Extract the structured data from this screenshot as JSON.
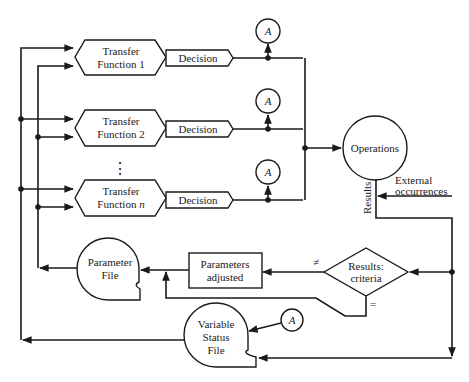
{
  "diagram": {
    "transfer_functions": [
      {
        "line1": "Transfer",
        "line2": "Function 1",
        "decision": "Decision",
        "monitor": "A"
      },
      {
        "line1": "Transfer",
        "line2": "Function 2",
        "decision": "Decision",
        "monitor": "A"
      },
      {
        "line1": "Transfer",
        "line2": "Function ",
        "line2_italic": "n",
        "decision": "Decision",
        "monitor": "A"
      }
    ],
    "ellipsis": "⋮",
    "operations": "Operations",
    "results_label": "Results",
    "external": {
      "line1": "External",
      "line2": "occurrences"
    },
    "criteria": {
      "line1": "Results:",
      "line2": "criteria"
    },
    "not_equal": "≠",
    "equal": "=",
    "params_adjusted": {
      "line1": "Parameters",
      "line2": "adjusted"
    },
    "parameter_file": {
      "line1": "Parameter",
      "line2": "File"
    },
    "variable_status_file": {
      "line1": "Variable",
      "line2": "Status",
      "line3": "File",
      "monitor": "A"
    }
  }
}
